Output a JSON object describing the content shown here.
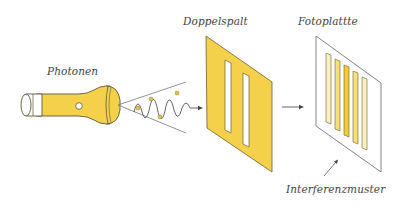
{
  "diagram": {
    "labels": {
      "source": "Photonen",
      "double_slit": "Doppelspalt",
      "screen": "Fotoplattte",
      "pattern": "Interferenzmuster"
    },
    "components": [
      {
        "id": "flashlight",
        "role": "light source emitting photons"
      },
      {
        "id": "photon-beam",
        "role": "cone with wave and particle dots"
      },
      {
        "id": "double-slit",
        "role": "yellow panel with two vertical slits"
      },
      {
        "id": "photo-plate",
        "role": "white plate showing five interference fringes"
      }
    ],
    "colors": {
      "yellow": "#f5d04a",
      "outline": "#5a5a3a",
      "line": "#555555",
      "fringe_light": "#f8f0c0",
      "fringe_mid": "#f3e07a",
      "fringe_bright": "#f2cb38"
    }
  }
}
